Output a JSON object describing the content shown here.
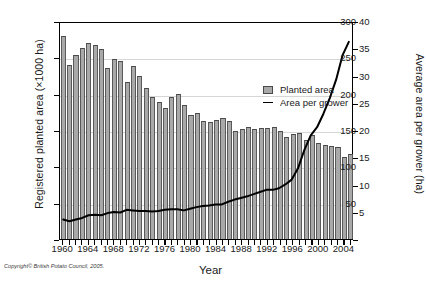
{
  "chart_data": {
    "type": "bar",
    "title": "",
    "xlabel": "Year",
    "ylabel": "Registered planted area (×1000 ha)",
    "ylabel_right": "Average area per grower (ha)",
    "ylim": [
      0,
      300
    ],
    "ylim_right": [
      0,
      40
    ],
    "yticks": [
      0,
      50,
      100,
      150,
      200,
      250,
      300
    ],
    "ytick_labels": [
      "",
      "50",
      "100",
      "150",
      "200",
      "250",
      "300"
    ],
    "yticks_right": [
      0,
      5,
      10,
      15,
      20,
      25,
      30,
      35,
      40
    ],
    "ytick_labels_right": [
      "",
      "5",
      "10",
      "15",
      "20",
      "25",
      "30",
      "35",
      "40"
    ],
    "xtick_labels": [
      "1960",
      "1964",
      "1968",
      "1972",
      "1976",
      "1980",
      "1984",
      "1988",
      "1992",
      "1996",
      "2000",
      "2004"
    ],
    "grid": true,
    "legend_position": "upper-center",
    "categories": [
      1960,
      1961,
      1962,
      1963,
      1964,
      1965,
      1966,
      1967,
      1968,
      1969,
      1970,
      1971,
      1972,
      1973,
      1974,
      1975,
      1976,
      1977,
      1978,
      1979,
      1980,
      1981,
      1982,
      1983,
      1984,
      1985,
      1986,
      1987,
      1988,
      1989,
      1990,
      1991,
      1992,
      1993,
      1994,
      1995,
      1996,
      1997,
      1998,
      1999,
      2000,
      2001,
      2002,
      2003,
      2004,
      2005
    ],
    "series": [
      {
        "name": "Planted area",
        "axis": "left",
        "unit": "×1000 ha",
        "type": "bar",
        "color": "#a9a9a9",
        "values": [
          280,
          240,
          253,
          263,
          270,
          267,
          262,
          236,
          248,
          245,
          216,
          238,
          225,
          208,
          195,
          189,
          180,
          195,
          199,
          184,
          171,
          173,
          162,
          161,
          164,
          166,
          162,
          149,
          151,
          154,
          151,
          153,
          153,
          154,
          148,
          140,
          145,
          146,
          136,
          143,
          132,
          129,
          128,
          127,
          113,
          117
        ]
      },
      {
        "name": "Area per grower",
        "axis": "right",
        "unit": "ha",
        "type": "line",
        "color": "#000000",
        "values": [
          3.6,
          3.3,
          3.6,
          3.9,
          4.4,
          4.5,
          4.4,
          4.8,
          5.0,
          4.9,
          5.4,
          5.3,
          5.2,
          5.2,
          5.1,
          5.2,
          5.4,
          5.5,
          5.5,
          5.3,
          5.6,
          5.9,
          6.1,
          6.2,
          6.4,
          6.4,
          6.9,
          7.3,
          7.6,
          7.9,
          8.3,
          8.7,
          9.1,
          9.1,
          9.4,
          10.1,
          11.0,
          13.1,
          16.5,
          19.2,
          20.7,
          23.2,
          26.1,
          29.5,
          34.0,
          36.5
        ]
      }
    ]
  },
  "legend": {
    "items": [
      {
        "label": "Planted area",
        "marker": "box"
      },
      {
        "label": "Area per grower",
        "marker": "line"
      }
    ]
  },
  "footer": {
    "copyright": "Copyright© British Potato Council, 2005."
  }
}
